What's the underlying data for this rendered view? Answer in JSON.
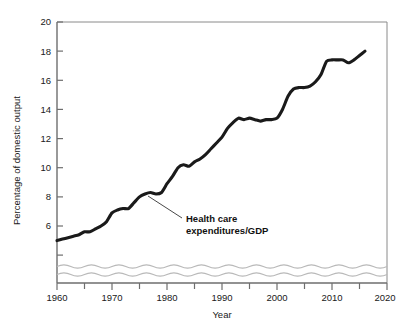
{
  "chart_data": {
    "type": "line",
    "title": "",
    "xlabel": "Year",
    "ylabel": "Percentage of domestic output",
    "xlim": [
      1960,
      2020
    ],
    "ylim": [
      4.6,
      20
    ],
    "grid": false,
    "legend_position": "none",
    "y_axis_break": true,
    "x_ticks_major": [
      "1960",
      "1970",
      "1980",
      "1990",
      "2000",
      "2010",
      "2020"
    ],
    "x_ticks_minor": [
      "1965",
      "1975",
      "1985",
      "1995",
      "2005",
      "2015"
    ],
    "y_ticks": [
      "6",
      "8",
      "10",
      "12",
      "14",
      "16",
      "18",
      "20"
    ],
    "series": [
      {
        "name": "Health care expenditures/GDP",
        "color": "#1a1a1a",
        "x": [
          1960,
          1961,
          1962,
          1963,
          1964,
          1965,
          1966,
          1967,
          1968,
          1969,
          1970,
          1971,
          1972,
          1973,
          1974,
          1975,
          1976,
          1977,
          1978,
          1979,
          1980,
          1981,
          1982,
          1983,
          1984,
          1985,
          1986,
          1987,
          1988,
          1989,
          1990,
          1991,
          1992,
          1993,
          1994,
          1995,
          1996,
          1997,
          1998,
          1999,
          2000,
          2001,
          2002,
          2003,
          2004,
          2005,
          2006,
          2007,
          2008,
          2009,
          2010,
          2011,
          2012,
          2013,
          2014,
          2015,
          2016
        ],
        "values": [
          5.0,
          5.1,
          5.2,
          5.3,
          5.4,
          5.6,
          5.6,
          5.8,
          6.0,
          6.3,
          6.9,
          7.1,
          7.2,
          7.2,
          7.6,
          8.0,
          8.2,
          8.3,
          8.2,
          8.3,
          8.9,
          9.4,
          10.0,
          10.2,
          10.1,
          10.4,
          10.6,
          10.9,
          11.3,
          11.7,
          12.1,
          12.7,
          13.1,
          13.4,
          13.3,
          13.4,
          13.3,
          13.2,
          13.3,
          13.3,
          13.4,
          14.0,
          14.9,
          15.4,
          15.5,
          15.5,
          15.6,
          15.9,
          16.4,
          17.3,
          17.4,
          17.4,
          17.4,
          17.2,
          17.4,
          17.7,
          18.0
        ]
      }
    ],
    "annotation": {
      "line1": "Health care",
      "line2": "expenditures/GDP",
      "pointer_from_x": 182,
      "pointer_from_y": 218,
      "pointer_to_x": 148,
      "pointer_to_y": 196
    }
  }
}
